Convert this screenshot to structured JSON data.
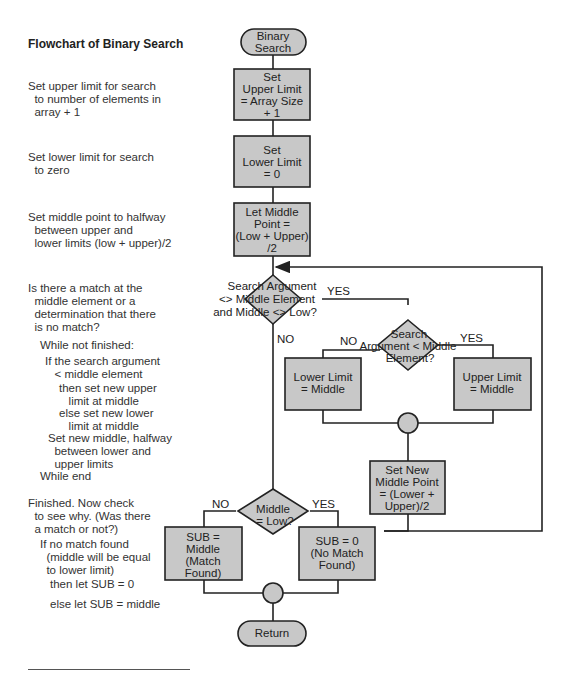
{
  "sidebar": {
    "title": "Flowchart of Binary Search",
    "notes": [
      "Set upper limit for search\n  to number of elements in\n  array + 1",
      "Set lower limit for search\n  to zero",
      "Set middle point to halfway\n  between upper and\n  lower limits (low + upper)/2",
      "Is there a match at the\n  middle element or a\n  determination that there\n  is no match?",
      "While not finished:",
      "If the search argument\n   < middle element",
      "then set new upper\n   limit at middle",
      "else set new lower\n   limit at middle",
      "Set new middle, halfway\n  between lower and\n  upper limits",
      "While end",
      "Finished. Now check\n  to see why. (Was there\n  a match or not?)",
      "If no match found\n  (middle will be equal\n  to lower limit)",
      "then let SUB = 0",
      "else let SUB = middle"
    ]
  },
  "flowchart": {
    "start": [
      "Binary",
      "Search"
    ],
    "set_upper": [
      "Set",
      "Upper Limit",
      "= Array Size",
      "+ 1"
    ],
    "set_lower": [
      "Set",
      "Lower Limit",
      "= 0"
    ],
    "let_middle": [
      "Let Middle",
      "Point =",
      "(Low + Upper)",
      "/2"
    ],
    "loop_decision": [
      "Search Argument",
      "<> Middle Element",
      "and Middle <> Low?"
    ],
    "compare_decision": [
      "Search",
      "Argument < Middle",
      "Element?"
    ],
    "lower_eq_middle": [
      "Lower Limit",
      "= Middle"
    ],
    "upper_eq_middle": [
      "Upper Limit",
      "= Middle"
    ],
    "new_middle": [
      "Set New",
      "Middle Point",
      "= (Lower +",
      "Upper)/2"
    ],
    "final_decision": [
      "Middle",
      "= Low?"
    ],
    "sub_middle": [
      "SUB =",
      "Middle",
      "(Match",
      "Found)"
    ],
    "sub_zero": [
      "SUB = 0",
      "(No Match",
      "Found)"
    ],
    "end": "Return",
    "labels": {
      "yes": "YES",
      "no": "NO"
    },
    "colors": {
      "fill": "#c8c8c8",
      "stroke": "#222222"
    }
  }
}
